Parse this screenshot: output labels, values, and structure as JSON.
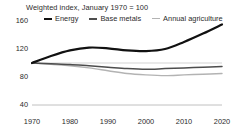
{
  "chart_data": {
    "type": "line",
    "title": "Weighted index, January 1970 = 100",
    "xlabel": "",
    "ylabel": "",
    "xlim": [
      1970,
      2020
    ],
    "ylim": [
      40,
      160
    ],
    "grid": true,
    "gridlines": [
      100,
      40
    ],
    "legend_position": "top",
    "y_ticks": [
      160,
      120,
      80,
      40
    ],
    "x_ticks": [
      1970,
      1980,
      1990,
      2000,
      2010,
      2020
    ],
    "x": [
      1970,
      1975,
      1980,
      1985,
      1990,
      1995,
      2000,
      2005,
      2010,
      2015,
      2020
    ],
    "series": [
      {
        "name": "Energy",
        "color": "#111111",
        "width": 2.2,
        "values": [
          100,
          110,
          118,
          122,
          121,
          118,
          117,
          120,
          130,
          142,
          155
        ]
      },
      {
        "name": "Base metals",
        "color": "#4d4d4d",
        "width": 1.5,
        "values": [
          100,
          99,
          98,
          96,
          94,
          92,
          91,
          92,
          93,
          94,
          95
        ]
      },
      {
        "name": "Annual agriculture",
        "color": "#b3b3b3",
        "width": 1.4,
        "values": [
          100,
          98,
          96,
          93,
          89,
          85,
          83,
          82,
          83,
          84,
          85
        ]
      }
    ]
  },
  "axis": {
    "y_ticks": [
      "160",
      "120",
      "80",
      "40"
    ],
    "x_ticks": [
      "1970",
      "1980",
      "1990",
      "2000",
      "2010",
      "2020"
    ]
  },
  "legend": {
    "items": [
      {
        "label": "Energy",
        "color": "#111111",
        "thickness": "2.4px"
      },
      {
        "label": "Base metals",
        "color": "#4d4d4d",
        "thickness": "1.8px"
      },
      {
        "label": "Annual agriculture",
        "color": "#b3b3b3",
        "thickness": "1.4px"
      }
    ]
  },
  "colors": {
    "background": "#ffffff",
    "text": "#2b2b2b",
    "gridline": "#c8c8c8",
    "baseline": "#b0b0b0"
  }
}
